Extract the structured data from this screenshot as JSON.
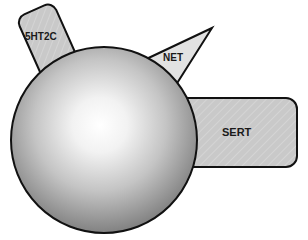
{
  "diagram": {
    "center_shape": {
      "type": "sphere",
      "highlight_color": "#ffffff",
      "shade_color": "#8a8a8a",
      "outline_color": "#111111"
    },
    "receptors": [
      {
        "id": "5ht2c",
        "label": "5HT2C",
        "shape": "rounded-rectangle",
        "fill": "#c8c8c8"
      },
      {
        "id": "net",
        "label": "NET",
        "shape": "triangle",
        "fill": "#e2e2e2"
      },
      {
        "id": "sert",
        "label": "SERT",
        "shape": "rounded-rectangle",
        "fill": "#c9c9c9"
      }
    ]
  }
}
